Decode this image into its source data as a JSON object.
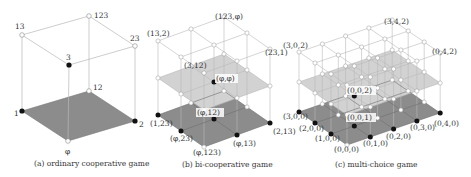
{
  "panels": [
    {
      "id": "a",
      "caption": "(a) ordinary cooperative game",
      "labels": {
        "v13": "13",
        "v123": "123",
        "v23": "23",
        "v3": "3",
        "v12": "12",
        "v1": "1",
        "v2": "2",
        "vphi": "φ"
      }
    },
    {
      "id": "b",
      "caption": "(b) bi-cooperative game",
      "labels": {
        "top": "(123,φ)",
        "left_top": "(13,2)",
        "right_top": "(23,1)",
        "mid_black": "(3,12)",
        "mid_center": "(φ,φ)",
        "low_black": "(φ,12)",
        "left_bottom": "(1,23)",
        "front_left": "(φ,23)",
        "front": "(φ,123)",
        "front_right": "(φ,13)",
        "right_bottom": "(2,13)"
      }
    },
    {
      "id": "c",
      "caption": "(c) multi-choice game",
      "labels": {
        "top": "(3,4,2)",
        "left_top": "(3,0,2)",
        "right_top": "(0,4,2)",
        "z2": "(0,0,2)",
        "z1": "(0,0,1)",
        "x3": "(3,0,0)",
        "x2": "(2,0,0)",
        "x1": "(1,0,0)",
        "origin": "(0,0,0)",
        "y1": "(0,1,0)",
        "y2": "(0,2,0)",
        "y3": "(0,3,0)",
        "y4": "(0,4,0)"
      }
    }
  ],
  "colors": {
    "floor_dark": "#8c8c8c",
    "floor_light": "#cfcfcf",
    "edge": "#b8b8b8",
    "node_black": "#111111",
    "node_white": "#ffffff"
  }
}
